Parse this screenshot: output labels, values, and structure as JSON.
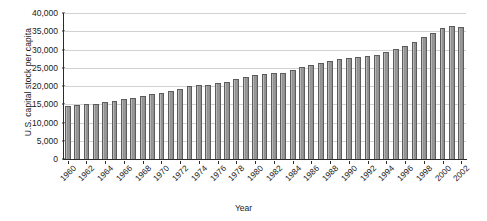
{
  "chart_data": {
    "type": "bar",
    "title": "",
    "xlabel": "Year",
    "ylabel": "U.S. capital stock per capita",
    "ylim": [
      0,
      40000
    ],
    "ytick_labels": [
      "40,000",
      "35,000",
      "30,000",
      "25,000",
      "20,000",
      "15,000",
      "10,000",
      "5,000",
      "0"
    ],
    "ytick_values": [
      40000,
      35000,
      30000,
      25000,
      20000,
      15000,
      10000,
      5000,
      0
    ],
    "grid": "horizontal",
    "legend": "none",
    "xtick_step": 2,
    "xtick_labels": [
      "1960",
      "1962",
      "1964",
      "1966",
      "1968",
      "1970",
      "1972",
      "1974",
      "1976",
      "1978",
      "1980",
      "1982",
      "1984",
      "1986",
      "1988",
      "1990",
      "1992",
      "1994",
      "1996",
      "1998",
      "2000",
      "2002"
    ],
    "categories": [
      "1960",
      "1961",
      "1962",
      "1963",
      "1964",
      "1965",
      "1966",
      "1967",
      "1968",
      "1969",
      "1970",
      "1971",
      "1972",
      "1973",
      "1974",
      "1975",
      "1976",
      "1977",
      "1978",
      "1979",
      "1980",
      "1981",
      "1982",
      "1983",
      "1984",
      "1985",
      "1986",
      "1987",
      "1988",
      "1989",
      "1990",
      "1991",
      "1992",
      "1993",
      "1994",
      "1995",
      "1996",
      "1997",
      "1998",
      "1999",
      "2000",
      "2001",
      "2002"
    ],
    "values": [
      14600,
      14800,
      15000,
      15200,
      15500,
      15900,
      16400,
      16800,
      17300,
      17800,
      18200,
      18600,
      19200,
      19900,
      20300,
      20400,
      20700,
      21200,
      21900,
      22600,
      23000,
      23400,
      23500,
      23700,
      24400,
      25100,
      25700,
      26200,
      26800,
      27400,
      27800,
      27900,
      28100,
      28600,
      29300,
      30100,
      31000,
      32100,
      33300,
      34600,
      35900,
      36400,
      36200
    ]
  },
  "colors": {
    "bar_fill": "#9a9a9a",
    "bar_edge": "#5c5c5c",
    "gridline": "#d2d2d2",
    "axis": "#2b2b2b",
    "text": "#1a1a1a",
    "background": "#ffffff"
  }
}
